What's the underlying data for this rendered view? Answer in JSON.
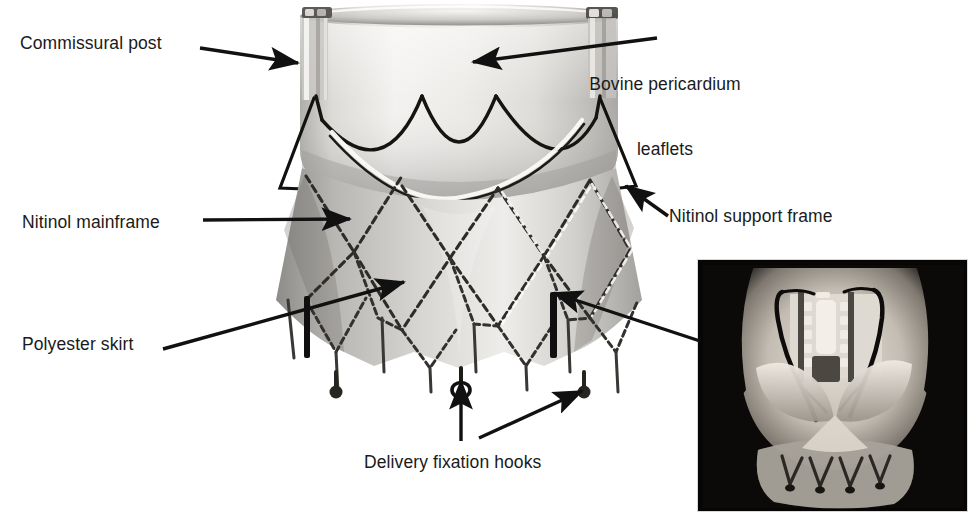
{
  "figure": {
    "background_color": "#ffffff",
    "width": 978,
    "height": 519
  },
  "labels": [
    {
      "id": "commissural-post",
      "text": "Commissural post",
      "x": 20,
      "y": 33,
      "align": "left"
    },
    {
      "id": "bovine-pericardium-leaflets",
      "text": "Bovine pericardium",
      "text2": "leaflets",
      "x": 665,
      "y": 30,
      "align": "center"
    },
    {
      "id": "nitinol-mainframe",
      "text": "Nitinol mainframe",
      "x": 22,
      "y": 212,
      "align": "left"
    },
    {
      "id": "nitinol-support-frame",
      "text": "Nitinol support frame",
      "x": 669,
      "y": 206,
      "align": "left"
    },
    {
      "id": "polyester-skirt",
      "text": "Polyester skirt",
      "x": 22,
      "y": 334,
      "align": "left"
    },
    {
      "id": "delivery-fixation-hooks",
      "text": "Delivery fixation hooks",
      "x": 364,
      "y": 452,
      "align": "left"
    }
  ],
  "arrows": [
    {
      "id": "arrow-commissural-post",
      "from": [
        200,
        48
      ],
      "to": [
        300,
        63
      ],
      "points_at": "commissural post on valve frame"
    },
    {
      "id": "arrow-bovine-pericardium-leaflets",
      "from": [
        657,
        38
      ],
      "to": [
        471,
        62
      ],
      "points_at": "bovine pericardium leaflet wall"
    },
    {
      "id": "arrow-nitinol-mainframe",
      "from": [
        203,
        220
      ],
      "to": [
        352,
        219
      ],
      "points_at": "nitinol mainframe strut"
    },
    {
      "id": "arrow-nitinol-support-frame",
      "from": [
        668,
        216
      ],
      "to": [
        624,
        184
      ],
      "points_at": "nitinol support frame arch"
    },
    {
      "id": "arrow-polyester-skirt",
      "from": [
        163,
        349
      ],
      "to": [
        406,
        281
      ],
      "points_at": "polyester skirt fabric"
    },
    {
      "id": "arrow-delivery-fixation-hook-left",
      "from": [
        461,
        441
      ],
      "to": [
        461,
        379
      ],
      "points_at": "left delivery fixation hook"
    },
    {
      "id": "arrow-delivery-fixation-hook-right",
      "from": [
        479,
        438
      ],
      "to": [
        584,
        390
      ],
      "points_at": "right delivery fixation hook"
    },
    {
      "id": "arrow-inset-to-hook",
      "from": [
        700,
        341
      ],
      "to": [
        552,
        292
      ],
      "points_at": "dark fixation bar on valve, linked from inset photo"
    }
  ],
  "main_image": {
    "name": "valve-prosthesis-photograph",
    "description": "Greyscale photograph of a self-expanding transcatheter heart valve: cylindrical upper cuff of bovine pericardium leaflets above a flared nitinol diamond-cell mainframe covered by a polyester skirt, with delivery fixation hooks at the lower margin."
  },
  "inset_image": {
    "name": "implanted-valve-photograph",
    "description": "Dark inset photograph showing the valve implanted in an explanted heart, viewed from the outflow side with sutures and frame struts visible.",
    "x": 697,
    "y": 259,
    "width": 271,
    "height": 253,
    "border_color": "#d8d8d8"
  },
  "colors": {
    "background": "#ffffff",
    "text": "#1a1a1a",
    "arrow": "#111111",
    "valve_light": "#f0efee",
    "valve_mid": "#bfbdba",
    "valve_dark": "#6e6c69",
    "frame_dark": "#4a4947",
    "inset_dark": "#0a0a0a",
    "inset_tissue": "#c8c2ba"
  }
}
